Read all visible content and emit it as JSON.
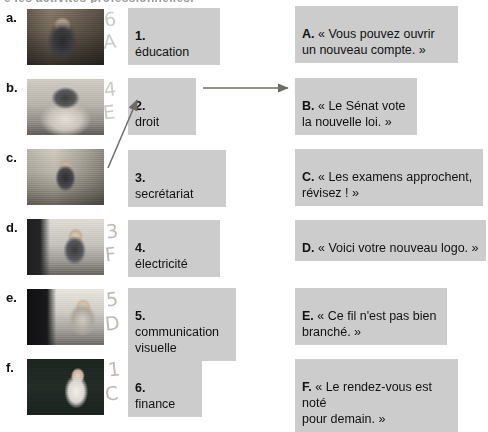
{
  "document": {
    "heading_remnant": "e les activités professionnelles.",
    "language": "fr"
  },
  "rows": [
    {
      "letter": "a.",
      "photo_name": "photo-a-man-at-desk",
      "photo_alt": "Homme souriant à un bureau"
    },
    {
      "letter": "b.",
      "photo_name": "photo-b-person-head-in-hands",
      "photo_alt": "Personne la tête dans les mains"
    },
    {
      "letter": "c.",
      "photo_name": "photo-c-woman-gesturing",
      "photo_alt": "Femme gesticulant à un bureau"
    },
    {
      "letter": "d.",
      "photo_name": "photo-d-woman-on-phone",
      "photo_alt": "Femme au téléphone devant un écran"
    },
    {
      "letter": "e.",
      "photo_name": "photo-e-person-at-computer",
      "photo_alt": "Personne devant un poste informatique"
    },
    {
      "letter": "f.",
      "photo_name": "photo-f-man-at-blackboard",
      "photo_alt": "Homme écrivant au tableau noir"
    }
  ],
  "middle_column": [
    {
      "number": "1.",
      "label": "éducation"
    },
    {
      "number": "2.",
      "label": "droit"
    },
    {
      "number": "3.",
      "label": "secrétariat"
    },
    {
      "number": "4.",
      "label": "électricité"
    },
    {
      "number": "5.",
      "label": "communication\nvisuelle"
    },
    {
      "number": "6.",
      "label": "finance"
    }
  ],
  "right_column": [
    {
      "letter": "A.",
      "quote": "« Vous pouvez ouvrir\nun nouveau compte. »"
    },
    {
      "letter": "B.",
      "quote": "« Le Sénat vote\nla nouvelle loi. »"
    },
    {
      "letter": "C.",
      "quote": "« Les examens approchent,\nrévisez ! »"
    },
    {
      "letter": "D.",
      "quote": "« Voici votre nouveau logo. »"
    },
    {
      "letter": "E.",
      "quote": "« Ce fil n'est pas bien\nbranché. »"
    },
    {
      "letter": "F.",
      "quote": "« Le rendez-vous est noté\npour demain. »"
    }
  ],
  "handwritten_answers": [
    {
      "row": "a.",
      "number": "6",
      "letter": "A"
    },
    {
      "row": "b.",
      "number": "4",
      "letter": "E"
    },
    {
      "row": "d.",
      "number": "3",
      "letter": "F"
    },
    {
      "row": "e.",
      "number": "5",
      "letter": "D"
    },
    {
      "row": "f.",
      "number": "1",
      "letter": "C"
    }
  ],
  "colors": {
    "highlight_background": "#cccccc",
    "text": "#111111",
    "pencil": "#b9b4ac",
    "page_background": "#ffffff"
  }
}
